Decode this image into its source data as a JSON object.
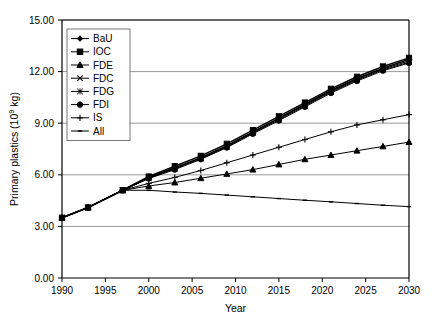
{
  "chart_data": {
    "type": "line",
    "title": "",
    "xlabel": "Year",
    "ylabel": "Primary plastics (10⁹ kg)",
    "ylabel_base": "Primary plastics (10",
    "ylabel_exp": "9",
    "ylabel_tail": " kg)",
    "xlim": [
      1990,
      2030
    ],
    "ylim": [
      0.0,
      15.0
    ],
    "grid": "horizontal",
    "legend_position": "top-left-inside",
    "xticks": [
      1990,
      1995,
      2000,
      2005,
      2010,
      2015,
      2020,
      2025,
      2030
    ],
    "xtick_labels": [
      "1990",
      "1995",
      "2000",
      "2005",
      "2010",
      "2015",
      "2020",
      "2025",
      "2030"
    ],
    "yticks": [
      0.0,
      3.0,
      6.0,
      9.0,
      12.0,
      15.0
    ],
    "ytick_labels": [
      "0.00",
      "3.00",
      "6.00",
      "9.00",
      "12.00",
      "15.00"
    ],
    "x": [
      1990,
      1993,
      1997,
      2000,
      2003,
      2006,
      2009,
      2012,
      2015,
      2018,
      2021,
      2024,
      2027,
      2030
    ],
    "historical_x": [
      1990,
      1993,
      1997
    ],
    "historical_y": [
      3.5,
      4.1,
      5.1
    ],
    "series": [
      {
        "name": "BaU",
        "marker": "diamond",
        "values": [
          3.5,
          4.1,
          5.1,
          5.85,
          6.4,
          7.0,
          7.7,
          8.5,
          9.3,
          10.1,
          10.9,
          11.6,
          12.2,
          12.7
        ]
      },
      {
        "name": "IOC",
        "marker": "square",
        "values": [
          3.5,
          4.1,
          5.1,
          5.9,
          6.5,
          7.1,
          7.8,
          8.6,
          9.4,
          10.2,
          11.0,
          11.7,
          12.3,
          12.8
        ]
      },
      {
        "name": "FDE",
        "marker": "triangle",
        "values": [
          3.5,
          4.1,
          5.1,
          5.35,
          5.55,
          5.8,
          6.05,
          6.3,
          6.6,
          6.9,
          7.15,
          7.4,
          7.65,
          7.9
        ]
      },
      {
        "name": "FDC",
        "marker": "x",
        "values": [
          3.5,
          4.1,
          5.1,
          5.82,
          6.38,
          6.97,
          7.66,
          8.46,
          9.26,
          10.05,
          10.85,
          11.55,
          12.15,
          12.62
        ]
      },
      {
        "name": "FDG",
        "marker": "star",
        "values": [
          3.5,
          4.1,
          5.1,
          5.8,
          6.35,
          6.94,
          7.62,
          8.42,
          9.2,
          10.0,
          10.8,
          11.5,
          12.1,
          12.55
        ]
      },
      {
        "name": "FDI",
        "marker": "circle",
        "values": [
          3.5,
          4.1,
          5.1,
          5.78,
          6.3,
          6.9,
          7.58,
          8.38,
          9.15,
          9.95,
          10.75,
          11.45,
          12.05,
          12.5
        ]
      },
      {
        "name": "IS",
        "marker": "plus",
        "values": [
          3.5,
          4.1,
          5.1,
          5.5,
          5.85,
          6.25,
          6.7,
          7.15,
          7.6,
          8.05,
          8.5,
          8.9,
          9.2,
          9.5
        ]
      },
      {
        "name": "All",
        "marker": "dash",
        "values": [
          3.5,
          4.1,
          5.1,
          5.1,
          5.0,
          4.92,
          4.82,
          4.72,
          4.62,
          4.52,
          4.43,
          4.33,
          4.23,
          4.15
        ]
      }
    ]
  },
  "legend": {
    "entries": [
      {
        "label": "BaU"
      },
      {
        "label": "IOC"
      },
      {
        "label": "FDE"
      },
      {
        "label": "FDC"
      },
      {
        "label": "FDG"
      },
      {
        "label": "FDI"
      },
      {
        "label": "IS"
      },
      {
        "label": "All"
      }
    ]
  },
  "colors": {
    "line": "#000000",
    "grid": "#808080",
    "axis": "#000000",
    "background": "#ffffff"
  }
}
